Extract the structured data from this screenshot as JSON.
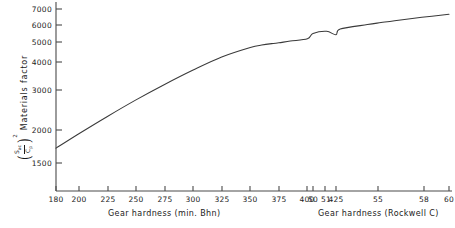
{
  "chart_data": {
    "type": "line",
    "title": "",
    "ylabel": "Materials factor",
    "ylabel_formula_numerator": "S",
    "ylabel_formula_numerator_sub": "ac",
    "ylabel_formula_denominator": "C",
    "ylabel_formula_denominator_sub": "p",
    "ylabel_formula_exponent": "2",
    "yscale": "log",
    "ylim": [
      1250,
      7600
    ],
    "yticks": [
      1500,
      2000,
      3000,
      4000,
      5000,
      6000,
      7000
    ],
    "ytick_labels": [
      "1500",
      "2000",
      "3000",
      "4000",
      "5000",
      "6000",
      "7000"
    ],
    "grid": false,
    "legend": "none",
    "xlabel_primary": "Gear hardness  (min. Bhn)",
    "xlabel_secondary": "Gear hardness (Rockwell C)",
    "xticks_bhn": [
      180,
      200,
      225,
      250,
      275,
      300,
      325,
      350,
      375,
      400,
      425
    ],
    "xtick_labels_bhn": [
      "180",
      "200",
      "225",
      "250",
      "275",
      "300",
      "325",
      "350",
      "375",
      "400",
      "425"
    ],
    "xticks_rockwell": [
      50,
      51,
      55,
      58,
      60
    ],
    "xtick_labels_rockwell": [
      "50",
      "51",
      "55",
      "58",
      "60"
    ],
    "series": [
      {
        "name": "materials-factor-curve",
        "color": "#3a3a3a",
        "x_bhn": [
          180,
          200,
          225,
          250,
          275,
          300,
          325,
          350,
          360,
          370,
          375,
          385,
          400,
          425
        ],
        "values": [
          1740,
          2010,
          2390,
          2820,
          3290,
          3800,
          4330,
          4760,
          4880,
          4960,
          4990,
          5080,
          5200,
          5410
        ]
      },
      {
        "name": "materials-factor-curve-rockwell-segment",
        "color": "#3a3a3a",
        "x_rockwell": [
          50,
          51,
          52,
          54,
          55,
          56,
          58,
          60
        ],
        "values": [
          5480,
          5600,
          5730,
          5990,
          6110,
          6230,
          6440,
          6640
        ]
      }
    ]
  }
}
